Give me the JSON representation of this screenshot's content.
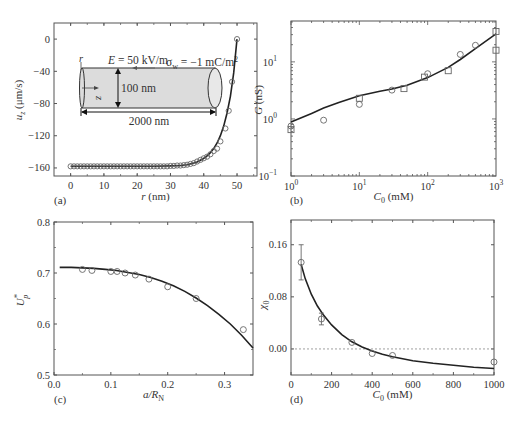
{
  "figure": {
    "panels": [
      "a",
      "b",
      "c",
      "d"
    ]
  },
  "colors": {
    "axis": "#555555",
    "curve": "#222222",
    "marker": "#666666",
    "nanochannel_fill": "#dcdcdc",
    "zero_line": "#888888"
  },
  "chart_data": [
    {
      "id": "a",
      "panel_label": "(a)",
      "type": "line",
      "title": "",
      "xlabel": "r (nm)",
      "xlabel_italic": "r",
      "xlabel_unit": " (nm)",
      "ylabel": "u_z (μm/s)",
      "ylabel_main": "u",
      "ylabel_sub": "z",
      "ylabel_unit": " (μm/s)",
      "xlim": [
        -5,
        56
      ],
      "ylim": [
        -170,
        20
      ],
      "xticks": [
        0,
        10,
        20,
        30,
        40,
        50
      ],
      "yticks": [
        0,
        -40,
        -80,
        -120,
        -160
      ],
      "ytick_labels": [
        "0",
        "-40",
        "-80",
        "-120",
        "-160"
      ],
      "grid": false,
      "frame_px": {
        "left": 54,
        "top": 23,
        "right": 257,
        "bottom": 176
      },
      "series": [
        {
          "name": "model (line)",
          "style": "line",
          "x": [
            0,
            5,
            10,
            15,
            20,
            25,
            30,
            33,
            35,
            37,
            38,
            39,
            40,
            41,
            42,
            43,
            44,
            45,
            46,
            47,
            48,
            49,
            50
          ],
          "y": [
            -158,
            -158,
            -158,
            -158,
            -158,
            -158,
            -157.5,
            -157,
            -156,
            -154,
            -152.5,
            -150.5,
            -148,
            -145,
            -141,
            -136,
            -129,
            -120,
            -108,
            -92,
            -71,
            -42,
            0
          ]
        },
        {
          "name": "simulation (circles)",
          "style": "circle",
          "x": [
            0,
            1,
            2,
            3,
            4,
            5,
            6,
            7,
            8,
            9,
            10,
            11,
            12,
            13,
            14,
            15,
            16,
            17,
            18,
            19,
            20,
            21,
            22,
            23,
            24,
            25,
            26,
            27,
            28,
            29,
            30,
            31,
            32,
            33,
            34,
            35,
            36,
            37,
            38,
            39,
            40,
            41,
            42,
            43,
            44,
            45,
            46.5,
            47.5,
            48.5,
            50
          ],
          "y": [
            -158,
            -158,
            -158,
            -158,
            -158,
            -158,
            -158,
            -158,
            -158,
            -158,
            -158,
            -158,
            -158,
            -158,
            -158,
            -158,
            -158,
            -158,
            -158,
            -158,
            -158,
            -158,
            -158,
            -158,
            -158,
            -158,
            -158,
            -158,
            -158,
            -158,
            -157.5,
            -157.5,
            -157,
            -157,
            -156.5,
            -156,
            -155,
            -154,
            -152,
            -150,
            -148,
            -146,
            -143,
            -139,
            -136,
            -127,
            -111,
            -89,
            -53,
            0
          ]
        }
      ],
      "inset": {
        "field_label": "E = 50 kV/m",
        "charge_label": "σ_w = −1 mC/m²",
        "charge_main": "σ",
        "charge_sub": "w",
        "charge_value": " = −1 mC/m",
        "charge_sup": "2",
        "diameter_label": "100 nm",
        "length_label": "2000 nm",
        "r_axis": "r",
        "z_axis": "z"
      }
    },
    {
      "id": "b",
      "panel_label": "(b)",
      "type": "line",
      "title": "",
      "xlabel": "C_0 (mM)",
      "xlabel_main": "C",
      "xlabel_sub": "0",
      "xlabel_unit": " (mM)",
      "ylabel": "G (nS)",
      "ylabel_main": "G",
      "ylabel_unit": " (nS)",
      "xscale": "log",
      "yscale": "log",
      "xlim": [
        1,
        1000
      ],
      "ylim": [
        0.1,
        52
      ],
      "xticks": [
        1,
        10,
        100,
        1000
      ],
      "xtick_exps": [
        "0",
        "1",
        "2",
        "3"
      ],
      "yticks": [
        0.1,
        1,
        10
      ],
      "ytick_exps": [
        "-1",
        "0",
        "1"
      ],
      "grid": false,
      "frame_px": {
        "left": 291,
        "top": 21,
        "right": 496,
        "bottom": 176
      },
      "series": [
        {
          "name": "model (line)",
          "style": "line",
          "x": [
            1,
            2,
            3,
            5,
            10,
            20,
            30,
            50,
            100,
            200,
            300,
            500,
            1000
          ],
          "y": [
            0.88,
            1.25,
            1.55,
            1.95,
            2.55,
            3.05,
            3.35,
            3.9,
            5.3,
            8.0,
            11.0,
            17.0,
            31.0
          ]
        },
        {
          "name": "experiment (circles)",
          "style": "circle",
          "x": [
            1,
            3,
            10,
            30,
            100,
            300,
            500
          ],
          "y": [
            0.75,
            0.95,
            1.8,
            3.2,
            6.2,
            13.5,
            19.5
          ]
        },
        {
          "name": "experiment (squares)",
          "style": "square",
          "x": [
            1,
            10,
            45,
            90,
            200,
            1000,
            1000
          ],
          "y": [
            0.65,
            2.3,
            3.4,
            5.4,
            7.0,
            34.0,
            16.0
          ]
        }
      ]
    },
    {
      "id": "c",
      "panel_label": "(c)",
      "type": "line",
      "title": "",
      "xlabel": "a/R_N",
      "xlabel_main": "a/R",
      "xlabel_sub": "N",
      "ylabel": "U*_p",
      "ylabel_main": "U",
      "ylabel_sup": "*",
      "ylabel_sub": "p",
      "xlim": [
        0.0,
        0.35
      ],
      "ylim": [
        0.5,
        0.8
      ],
      "xticks": [
        0.0,
        0.1,
        0.2,
        0.3
      ],
      "xtick_labels": [
        "0.0",
        "0.1",
        "0.2",
        "0.3"
      ],
      "yticks": [
        0.5,
        0.6,
        0.7,
        0.8
      ],
      "ytick_labels": [
        "0.5",
        "0.6",
        "0.7",
        "0.8"
      ],
      "grid": false,
      "frame_px": {
        "left": 54,
        "top": 222,
        "right": 253,
        "bottom": 375
      },
      "series": [
        {
          "name": "model (line)",
          "style": "line",
          "x": [
            0.01,
            0.03,
            0.05,
            0.07,
            0.09,
            0.11,
            0.13,
            0.15,
            0.17,
            0.19,
            0.21,
            0.23,
            0.25,
            0.27,
            0.29,
            0.31,
            0.33,
            0.35
          ],
          "y": [
            0.711,
            0.711,
            0.71,
            0.709,
            0.707,
            0.705,
            0.701,
            0.697,
            0.691,
            0.684,
            0.675,
            0.664,
            0.651,
            0.636,
            0.619,
            0.6,
            0.578,
            0.553
          ]
        },
        {
          "name": "simulation (circles)",
          "style": "circle",
          "x": [
            0.05,
            0.0667,
            0.1,
            0.111,
            0.125,
            0.143,
            0.167,
            0.2,
            0.25,
            0.333
          ],
          "y": [
            0.707,
            0.705,
            0.703,
            0.703,
            0.7,
            0.696,
            0.688,
            0.673,
            0.65,
            0.589
          ]
        }
      ]
    },
    {
      "id": "d",
      "panel_label": "(d)",
      "type": "line",
      "title": "",
      "xlabel": "C_0 (mM)",
      "xlabel_main": "C",
      "xlabel_sub": "0",
      "xlabel_unit": " (mM)",
      "ylabel": "χ_0",
      "ylabel_main": "χ",
      "ylabel_sub": "0",
      "xlim": [
        0,
        1000
      ],
      "ylim": [
        -0.04,
        0.198
      ],
      "xticks": [
        0,
        200,
        400,
        600,
        800,
        1000
      ],
      "xtick_labels": [
        "0",
        "200",
        "400",
        "600",
        "800",
        "1000"
      ],
      "yticks": [
        0.16,
        0.08,
        0.0
      ],
      "ytick_labels": [
        "0.16",
        "0.08",
        "0.00"
      ],
      "grid": false,
      "reference_line": {
        "y": 0.0,
        "style": "dashed"
      },
      "frame_px": {
        "left": 291,
        "top": 220,
        "right": 494,
        "bottom": 375
      },
      "series": [
        {
          "name": "model (line)",
          "style": "line",
          "x": [
            50,
            70,
            100,
            130,
            160,
            200,
            250,
            300,
            350,
            400,
            450,
            500,
            600,
            700,
            800,
            900,
            1000
          ],
          "y": [
            0.13,
            0.108,
            0.084,
            0.066,
            0.052,
            0.037,
            0.022,
            0.011,
            0.003,
            -0.003,
            -0.008,
            -0.012,
            -0.018,
            -0.022,
            -0.025,
            -0.028,
            -0.03
          ]
        },
        {
          "name": "data (circles with error bars)",
          "style": "circle",
          "x": [
            50,
            150,
            300,
            400,
            500,
            1000
          ],
          "y": [
            0.133,
            0.046,
            0.01,
            -0.007,
            -0.01,
            -0.02
          ],
          "yerr": [
            0.027,
            0.009,
            0,
            0,
            0,
            0
          ]
        }
      ]
    }
  ]
}
